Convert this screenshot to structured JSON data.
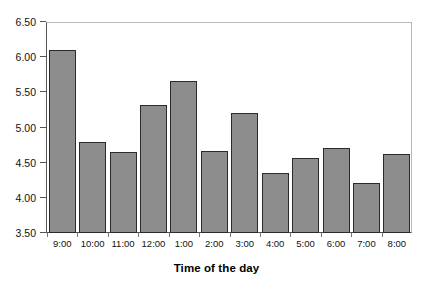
{
  "chart_data": {
    "type": "bar",
    "title": "",
    "xlabel": "Time of the day",
    "ylabel": "",
    "categories": [
      "9:00",
      "10:00",
      "11:00",
      "12:00",
      "1:00",
      "2:00",
      "3:00",
      "4:00",
      "5:00",
      "6:00",
      "7:00",
      "8:00"
    ],
    "values": [
      6.1,
      4.8,
      4.65,
      5.32,
      5.66,
      4.66,
      5.21,
      4.36,
      4.57,
      4.71,
      4.21,
      4.63
    ],
    "ylim": [
      3.5,
      6.5
    ],
    "ytick_step": 0.5,
    "ytick_labels": [
      "6.50",
      "6.00",
      "5.50",
      "5.00",
      "4.50",
      "4.00",
      "3.50"
    ],
    "ytick_values": [
      6.5,
      6.0,
      5.5,
      5.0,
      4.5,
      4.0,
      3.5
    ],
    "grid": false,
    "legend": null,
    "bar_fill_color": "#8d8d8d",
    "bar_border_color": "#2b2b2b",
    "frame_color": "#555555",
    "background_color": "#ffffff"
  }
}
